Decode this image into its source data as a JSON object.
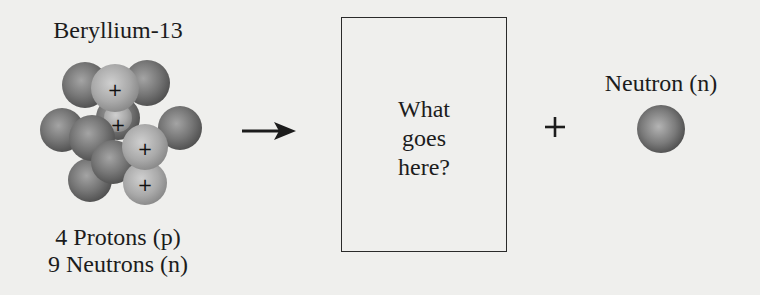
{
  "diagram": {
    "reactant": {
      "name": "Beryllium-13",
      "protons_label": "4 Protons (p)",
      "neutrons_label": "9 Neutrons (n)",
      "proton_count": 4,
      "neutron_count": 9,
      "proton_symbol": "+"
    },
    "arrow": "→",
    "unknown_product": {
      "lines": [
        "What",
        "goes",
        "here?"
      ]
    },
    "plus": "+",
    "product": {
      "name": "Neutron (n)"
    },
    "colors": {
      "background": "#efefed",
      "neutron_sphere": "#6e6e6e",
      "proton_sphere": "#a8a8a8",
      "ink": "#1c1c1c"
    }
  }
}
